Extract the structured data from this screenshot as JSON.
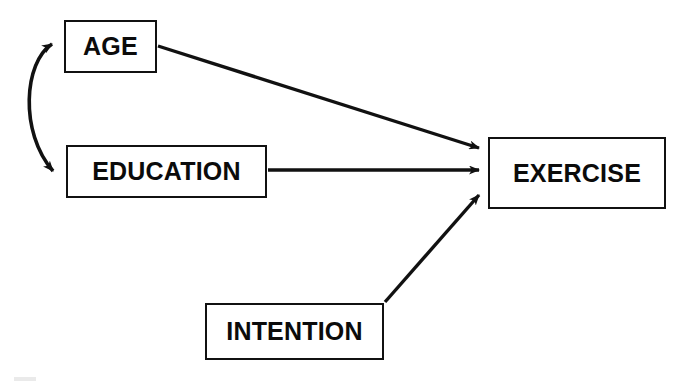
{
  "diagram": {
    "background_color": "#ffffff",
    "stroke_color": "#111111",
    "text_color": "#0b0b0b",
    "nodes": [
      {
        "id": "age",
        "label": "AGE"
      },
      {
        "id": "education",
        "label": "EDUCATION"
      },
      {
        "id": "intention",
        "label": "INTENTION"
      },
      {
        "id": "exercise",
        "label": "EXERCISE"
      }
    ],
    "edges": [
      {
        "id": "age-exercise",
        "from": "AGE",
        "to": "EXERCISE",
        "style": "straight",
        "arrowheads": "single"
      },
      {
        "id": "education-exercise",
        "from": "EDUCATION",
        "to": "EXERCISE",
        "style": "straight",
        "arrowheads": "single"
      },
      {
        "id": "intention-exercise",
        "from": "INTENTION",
        "to": "EXERCISE",
        "style": "straight",
        "arrowheads": "single"
      },
      {
        "id": "age-education",
        "from": "AGE",
        "to": "EDUCATION",
        "style": "curved",
        "arrowheads": "double"
      }
    ]
  }
}
